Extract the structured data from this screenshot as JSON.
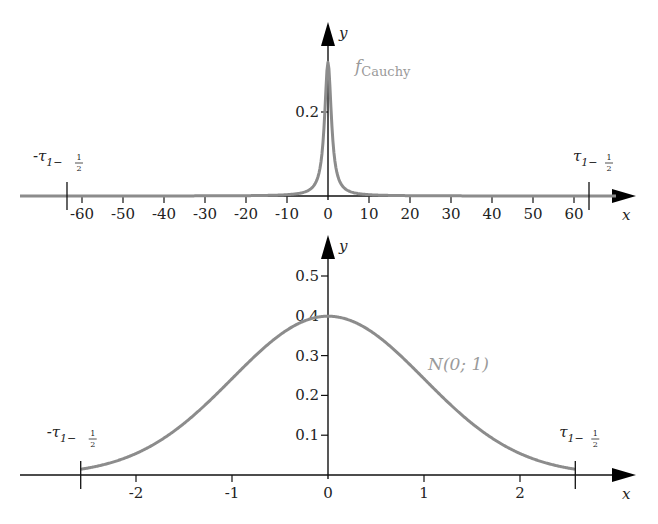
{
  "chart_data": [
    {
      "type": "line",
      "title": "",
      "xlabel": "x",
      "ylabel": "y",
      "series": [
        {
          "name": "f_Cauchy",
          "label_main": "f",
          "label_sub": "Cauchy",
          "formula": "1/(pi*(1+x^2))",
          "color": "#8c8c8c"
        }
      ],
      "x_ticks": [
        -60,
        -50,
        -40,
        -30,
        -20,
        -10,
        0,
        10,
        20,
        30,
        40,
        50,
        60
      ],
      "x_tick_labels": [
        "-60",
        "-50",
        "-40",
        "-30",
        "-20",
        "-10",
        "0",
        "10",
        "20",
        "30",
        "40",
        "50",
        "60"
      ],
      "y_ticks": [
        0.2
      ],
      "y_tick_labels": [
        "0.2"
      ],
      "xlim": [
        -75,
        75
      ],
      "ylim": [
        0,
        0.35
      ],
      "peak": 0.318,
      "markers": [
        {
          "x": -63.66,
          "label": "-τ",
          "sub": "1−",
          "frac_num": "1",
          "frac_den": "2"
        },
        {
          "x": 63.66,
          "label": "τ",
          "sub": "1−",
          "frac_num": "1",
          "frac_den": "2"
        }
      ],
      "grid": false,
      "legend": "inline label near curve"
    },
    {
      "type": "line",
      "title": "",
      "xlabel": "x",
      "ylabel": "y",
      "series": [
        {
          "name": "N(0;1)",
          "label": "N(0; 1)",
          "formula": "exp(-x^2/2)/sqrt(2*pi)",
          "color": "#8c8c8c"
        }
      ],
      "x_ticks": [
        -2,
        -1,
        0,
        1,
        2
      ],
      "x_tick_labels": [
        "-2",
        "-1",
        "0",
        "1",
        "2"
      ],
      "y_ticks": [
        0.1,
        0.2,
        0.3,
        0.4,
        0.5
      ],
      "y_tick_labels": [
        "0.1",
        "0.2",
        "0.3",
        "0.4",
        "0.5"
      ],
      "xlim": [
        -3.2,
        3.2
      ],
      "ylim": [
        0,
        0.55
      ],
      "peak": 0.399,
      "markers": [
        {
          "x": -2.576,
          "label": "-τ",
          "sub": "1−",
          "frac_num": "1",
          "frac_den": "2"
        },
        {
          "x": 2.576,
          "label": "τ",
          "sub": "1−",
          "frac_num": "1",
          "frac_den": "2"
        }
      ],
      "grid": false,
      "legend": "inline label near curve"
    }
  ]
}
